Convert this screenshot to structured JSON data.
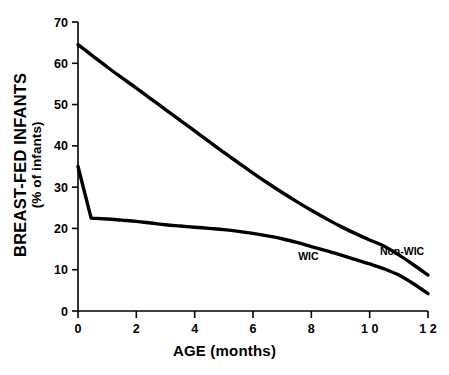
{
  "chart_data": {
    "type": "line",
    "title": "",
    "subtitle": "",
    "xlabel": "AGE (months)",
    "ylabel": "BREAST-FED INFANTS",
    "ylabel_sub": "(% of infants)",
    "xlim": [
      0,
      12
    ],
    "ylim": [
      0,
      70
    ],
    "grid": false,
    "legend_position": "inline-annotation",
    "xticks": [
      0,
      2,
      4,
      6,
      8,
      10,
      12
    ],
    "xtick_labels": [
      "0",
      "2",
      "4",
      "6",
      "8",
      "1 0",
      "1 2"
    ],
    "yticks": [
      0,
      10,
      20,
      30,
      40,
      50,
      60,
      70
    ],
    "ytick_labels": [
      "0",
      "10",
      "20",
      "30",
      "40",
      "50",
      "60",
      "70"
    ],
    "line_color": "#000000",
    "background_color": "#ffffff",
    "series": [
      {
        "name": "Non-WIC",
        "label": "Non-WIC",
        "label_x": 10.35,
        "label_y": 13.6,
        "x": [
          0,
          0.5,
          1,
          1.5,
          2,
          2.5,
          3,
          3.5,
          4,
          4.5,
          5,
          5.5,
          6,
          6.5,
          7,
          7.5,
          8,
          8.5,
          9,
          9.5,
          10,
          10.5,
          11,
          11.5,
          12
        ],
        "values": [
          64.5,
          61.8,
          59.1,
          56.5,
          54.0,
          51.4,
          48.8,
          46.2,
          43.6,
          41.0,
          38.4,
          35.9,
          33.4,
          31.0,
          28.7,
          26.5,
          24.4,
          22.4,
          20.5,
          18.8,
          17.2,
          15.7,
          13.6,
          11.2,
          8.7
        ]
      },
      {
        "name": "WIC",
        "label": "WIC",
        "label_x": 7.55,
        "label_y": 12.3,
        "x": [
          0,
          0.45,
          1,
          1.5,
          2,
          2.5,
          3,
          3.5,
          4,
          4.5,
          5,
          5.5,
          6,
          6.5,
          7,
          7.5,
          8,
          8.5,
          9,
          9.5,
          10,
          10.5,
          11,
          11.5,
          12
        ],
        "values": [
          35.0,
          22.5,
          22.3,
          22.0,
          21.7,
          21.3,
          20.9,
          20.6,
          20.3,
          20.0,
          19.7,
          19.3,
          18.8,
          18.2,
          17.5,
          16.6,
          15.6,
          14.6,
          13.6,
          12.5,
          11.4,
          10.2,
          8.7,
          6.6,
          4.2
        ]
      }
    ],
    "notes": {
      "crossover_month": 7.5,
      "crossover_value": 16.0
    }
  }
}
